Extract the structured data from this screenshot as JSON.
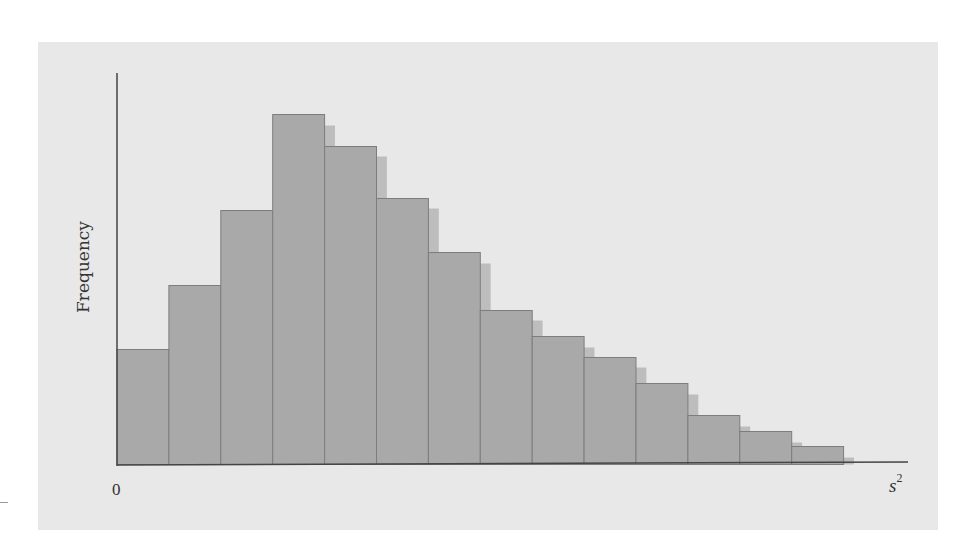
{
  "chart_data": {
    "type": "bar",
    "subtype": "histogram",
    "title": "",
    "xlabel": "s²",
    "ylabel": "Frequency",
    "x_tick_labels": [
      "0"
    ],
    "grid": false,
    "legend": null,
    "categories": [
      "bin1",
      "bin2",
      "bin3",
      "bin4",
      "bin5",
      "bin6",
      "bin7",
      "bin8",
      "bin9",
      "bin10",
      "bin11",
      "bin12",
      "bin13",
      "bin14"
    ],
    "series": [
      {
        "name": "Frequency (relative bar heights, px)",
        "values": [
          115,
          179,
          254,
          350,
          318,
          266,
          212,
          154,
          128,
          107,
          81,
          49,
          33,
          18
        ]
      },
      {
        "name": "Shadow (offset theoretical curve, relative heights, px)",
        "values": [
          null,
          null,
          null,
          339,
          308,
          256,
          201,
          144,
          117,
          97,
          70,
          38,
          22,
          7
        ]
      }
    ],
    "ylim": [
      0,
      391
    ],
    "colors": {
      "bar_fill": "#a9a9a9",
      "bar_stroke": "#7d7d7d",
      "shadow_fill": "#bdbdbd",
      "panel_bg": "#e8e8e8",
      "axis": "#444444"
    }
  },
  "labels": {
    "ylabel": "Frequency",
    "x_origin": "0",
    "xlabel_base": "s",
    "xlabel_sup": "2"
  }
}
